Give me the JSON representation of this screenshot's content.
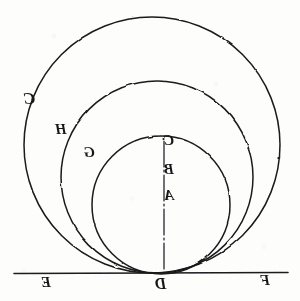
{
  "figure": {
    "orientation": "mirrored",
    "background_color": "#fdfdfb",
    "ink_color": "#1a1a1c",
    "baseline": {
      "name": "tangent-line",
      "y": 273,
      "x_start": 14,
      "x_end": 288,
      "left_label": "E",
      "right_label": "F",
      "tangent_point_label": "D"
    },
    "axis": {
      "name": "vertical-diameter",
      "x": 164,
      "y_top": 141,
      "y_bottom": 273,
      "style": "dash-dot"
    },
    "circles": [
      {
        "id": "outer",
        "label": "C",
        "label_x": 27,
        "label_y": 96,
        "cx": 152,
        "cy": 145,
        "r": 128,
        "top_y": 17,
        "left_x": 24,
        "right_x": 280
      },
      {
        "id": "middle",
        "label": "H",
        "label_x": 57,
        "label_y": 126,
        "cx": 157,
        "cy": 177,
        "r": 96,
        "top_y": 81,
        "left_x": 61,
        "right_x": 253
      },
      {
        "id": "inner",
        "label": "G",
        "label_x": 85,
        "label_y": 148,
        "cx": 161,
        "cy": 205,
        "r": 69,
        "top_y": 136,
        "left_x": 92,
        "right_x": 230
      }
    ],
    "axis_points": [
      {
        "label": "C",
        "x": 166,
        "y": 139,
        "dot": true,
        "dot_x": 163,
        "dot_y": 139
      },
      {
        "label": "B",
        "x": 166,
        "y": 169,
        "dot": false
      },
      {
        "label": "A",
        "x": 166,
        "y": 194,
        "dot": false
      }
    ],
    "labels": {
      "A": "A",
      "B": "B",
      "C": "C",
      "D": "D",
      "E": "E",
      "F": "F",
      "G": "G",
      "H": "H"
    },
    "label_positions": {
      "D": {
        "x": 156,
        "y": 278
      },
      "E": {
        "x": 42,
        "y": 277
      },
      "F": {
        "x": 261,
        "y": 275
      }
    }
  }
}
